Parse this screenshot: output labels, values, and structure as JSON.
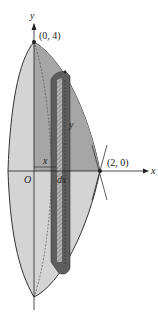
{
  "figure": {
    "labels": {
      "y_axis": "y",
      "x_axis": "x",
      "origin": "O",
      "top_point": "(0, 4)",
      "right_point": "(2, 0)",
      "shell_radius": "x",
      "shell_thickness": "dx",
      "shell_height": "y"
    },
    "colors": {
      "solid_light": "#d2d2d2",
      "solid_mid": "#a8a8a8",
      "shell_dark": "#5e5e5e",
      "shell_hatch": "#8c8c8c",
      "outline": "#333333",
      "background": "#ffffff"
    }
  }
}
